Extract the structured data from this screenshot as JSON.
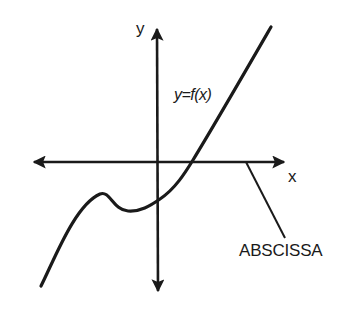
{
  "diagram": {
    "labels": {
      "y_axis": "y",
      "x_axis": "x",
      "function": "y=f(x)",
      "callout": "ABSCISSA"
    },
    "colors": {
      "ink": "#1a1a1a",
      "background": "#ffffff"
    },
    "elements": {
      "x_axis": {
        "from": [
          23,
          162
        ],
        "to": [
          294,
          162
        ],
        "arrows": "both"
      },
      "y_axis": {
        "from": [
          157,
          18
        ],
        "to": [
          158,
          302
        ],
        "arrows": "both"
      },
      "curve": {
        "start": [
          41,
          286
        ],
        "local_max": [
          103,
          195
        ],
        "local_min": [
          127,
          211
        ],
        "y_intercept": [
          158,
          199
        ],
        "x_intercept": [
          191,
          162
        ],
        "end": [
          271,
          27
        ]
      },
      "leader_line": {
        "from": [
          246,
          162
        ],
        "to": [
          285,
          238
        ],
        "points_to": "x-axis"
      }
    }
  }
}
